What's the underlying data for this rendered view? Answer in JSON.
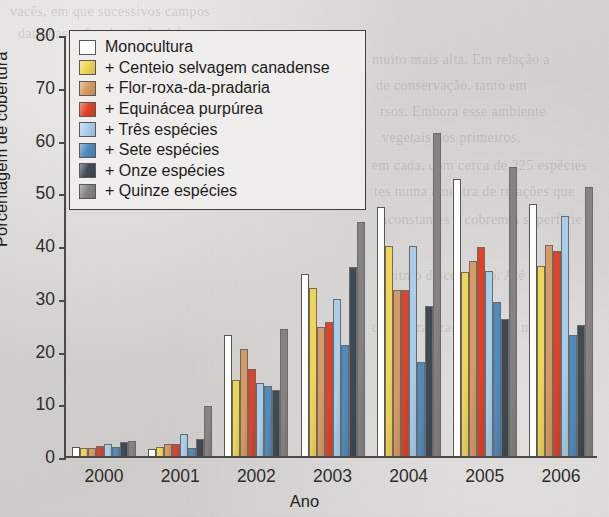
{
  "chart_data": {
    "type": "bar",
    "title": "",
    "xlabel": "Ano",
    "ylabel": "Porcentagem de cobertura",
    "categories": [
      "2000",
      "2001",
      "2002",
      "2003",
      "2004",
      "2005",
      "2006"
    ],
    "ylim": [
      0,
      80
    ],
    "yticks": [
      0,
      10,
      20,
      30,
      40,
      50,
      60,
      70,
      80
    ],
    "grid": false,
    "legend_position": "upper-left-inside",
    "series": [
      {
        "name": "Monocultura",
        "color": "#ffffff",
        "values": [
          1.8,
          1.3,
          23.0,
          34.5,
          47.2,
          52.5,
          47.8
        ]
      },
      {
        "name": "+ Centeio selvagem canadense",
        "color": "#f2d455",
        "values": [
          1.5,
          1.7,
          14.5,
          31.8,
          39.8,
          34.8,
          36.0
        ]
      },
      {
        "name": "+ Flor-roxa-da-pradaria",
        "color": "#d89a62",
        "values": [
          1.5,
          2.2,
          20.2,
          24.5,
          31.5,
          37.0,
          40.0
        ]
      },
      {
        "name": "+ Equinácea purpúrea",
        "color": "#e04227",
        "values": [
          1.9,
          2.3,
          16.5,
          25.5,
          31.5,
          39.7,
          38.8
        ]
      },
      {
        "name": "+ Três espécies",
        "color": "#a9cdea",
        "values": [
          2.2,
          4.2,
          13.8,
          29.8,
          39.8,
          35.0,
          45.5
        ]
      },
      {
        "name": "+ Sete espécies",
        "color": "#4e8bc0",
        "values": [
          1.8,
          1.5,
          13.2,
          21.0,
          17.8,
          29.2,
          23.0
        ]
      },
      {
        "name": "+ Onze espécies",
        "color": "#3f4a55",
        "values": [
          2.6,
          3.2,
          12.6,
          35.8,
          28.5,
          26.0,
          24.8
        ]
      },
      {
        "name": "+ Quinze espécies",
        "color": "#848382",
        "values": [
          2.8,
          9.4,
          24.0,
          44.3,
          61.2,
          54.8,
          51.0
        ]
      }
    ]
  },
  "background_text": [
    "vacês, em que sucessivos campos",
    "data-base são plantas herbáceas",
    "muito mais alta. Em relação a",
    "de conservação, tanto em",
    "rsos. Embora esse ambiente",
    "vegetais dos primeiros,",
    "em cada, com cerca de 225 espécies",
    "tes numa amostra de relações que",
    "inconstantes e cobrem a superfície",
    "o ritmo de consumo. Até a série",
    "cobertura gradualmente, mas vez"
  ]
}
